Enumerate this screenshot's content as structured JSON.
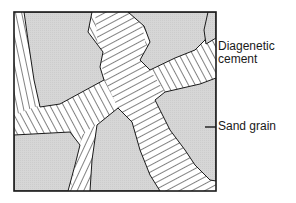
{
  "diagram": {
    "labels": {
      "cement_line1": "Diagenetic",
      "cement_line2": "cement",
      "sand": "Sand grain"
    },
    "colors": {
      "grain_fill": "#d4d4d4",
      "cement_fill": "#ffffff",
      "stroke": "#1a1a1a"
    },
    "components": [
      "Sand grain",
      "Diagenetic cement"
    ]
  }
}
